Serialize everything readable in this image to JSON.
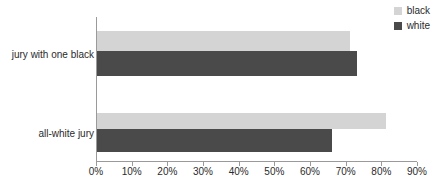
{
  "chart_data": {
    "type": "bar",
    "orientation": "horizontal",
    "title": "",
    "xlabel": "",
    "ylabel": "",
    "categories": [
      "jury with one black",
      "all-white jury"
    ],
    "series": [
      {
        "name": "black",
        "color": "#d4d4d4",
        "values": [
          71,
          81
        ]
      },
      {
        "name": "white",
        "color": "#4a4a4a",
        "values": [
          73,
          66
        ]
      }
    ],
    "xlim": [
      0,
      90
    ],
    "xticks": [
      0,
      10,
      20,
      30,
      40,
      50,
      60,
      70,
      80,
      90
    ],
    "xtick_labels": [
      "0%",
      "10%",
      "20%",
      "30%",
      "40%",
      "50%",
      "60%",
      "70%",
      "80%",
      "90%"
    ],
    "value_suffix": "%",
    "grid": false,
    "legend_position": "top-right",
    "legend": [
      {
        "label": "black",
        "color": "#d4d4d4"
      },
      {
        "label": "white",
        "color": "#4a4a4a"
      }
    ],
    "axis_color": "#9a9a9a",
    "text_color": "#2b2b2b",
    "background": "#ffffff"
  }
}
